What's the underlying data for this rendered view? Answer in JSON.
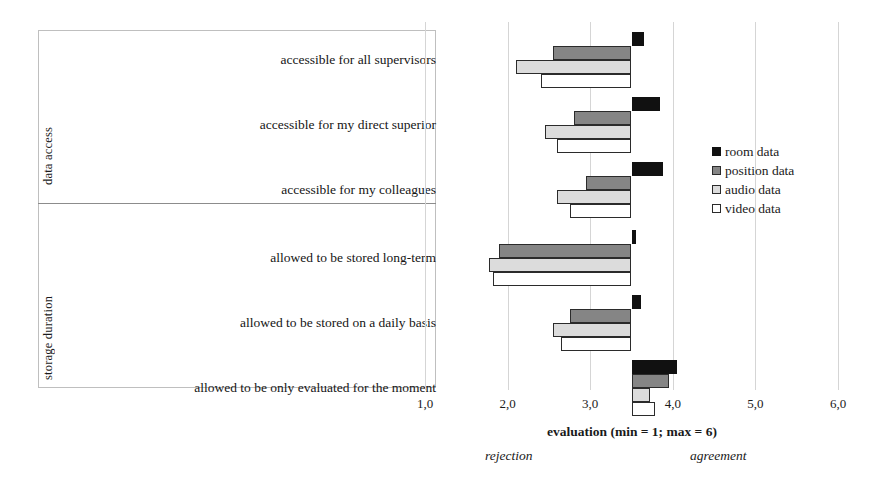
{
  "groups": [
    {
      "title": "data access"
    },
    {
      "title": "storage duration"
    }
  ],
  "legend": {
    "items": [
      {
        "label": "room data",
        "color": "#111111"
      },
      {
        "label": "position data",
        "color": "#858585"
      },
      {
        "label": "audio data",
        "color": "#dcdcdc"
      },
      {
        "label": "video data",
        "color": "#ffffff"
      }
    ]
  },
  "axis": {
    "title": "evaluation (min = 1; max = 6)",
    "ticks": [
      "1,0",
      "2,0",
      "3,0",
      "4,0",
      "5,0",
      "6,0"
    ],
    "low_anchor": "rejection",
    "high_anchor": "agreement"
  },
  "chart_data": {
    "type": "bar",
    "orientation": "horizontal",
    "title": "",
    "xlabel": "evaluation (min = 1; max = 6)",
    "ylabel": "",
    "xlim": [
      1.0,
      6.0
    ],
    "xticks": [
      1.0,
      2.0,
      3.0,
      4.0,
      5.0,
      6.0
    ],
    "grid": true,
    "legend_position": "right",
    "baseline": 3.5,
    "note": "bars are drawn from a 3,5 baseline; values below 3,5 extend left, values above extend right",
    "categories": [
      "accessible for all supervisors",
      "accessible for my direct superior",
      "accessible for my colleagues",
      "allowed to be stored long-term",
      "allowed to be stored on a daily basis",
      "allowed to be only evaluated for the moment"
    ],
    "category_groups": [
      {
        "name": "data access",
        "categories": [
          0,
          1,
          2
        ]
      },
      {
        "name": "storage duration",
        "categories": [
          3,
          4,
          5
        ]
      }
    ],
    "series": [
      {
        "name": "room data",
        "color": "#111111",
        "values": [
          3.65,
          3.85,
          3.88,
          3.55,
          3.62,
          4.05
        ]
      },
      {
        "name": "position data",
        "color": "#858585",
        "values": [
          2.55,
          2.8,
          2.95,
          1.9,
          2.75,
          3.95
        ]
      },
      {
        "name": "audio data",
        "color": "#dcdcdc",
        "values": [
          2.1,
          2.45,
          2.6,
          1.78,
          2.55,
          3.72
        ]
      },
      {
        "name": "video data",
        "color": "#ffffff",
        "values": [
          2.4,
          2.6,
          2.75,
          1.82,
          2.65,
          3.78
        ]
      }
    ]
  }
}
